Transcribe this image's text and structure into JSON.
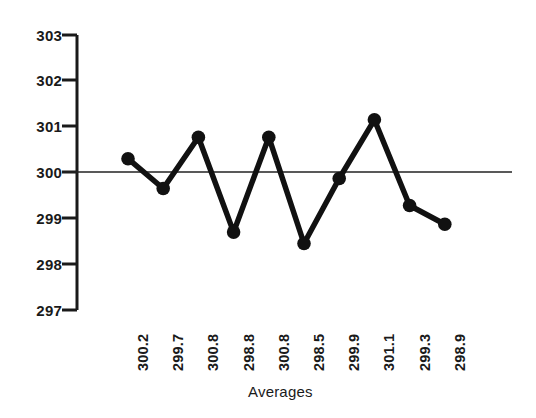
{
  "chart_data": {
    "type": "line",
    "title": "",
    "subtitle": "",
    "xlabel": "Averages",
    "ylabel": "",
    "grid": false,
    "legend": null,
    "ylim": [
      297,
      303
    ],
    "yticks": [
      303,
      302,
      301,
      300,
      299,
      298,
      297
    ],
    "ytick_labels": [
      "303",
      "302",
      "301",
      "300",
      "299",
      "298",
      "297"
    ],
    "categories": [
      "300.2",
      "299.7",
      "300.8",
      "298.8",
      "300.8",
      "298.5",
      "299.9",
      "301.1",
      "299.3",
      "298.9"
    ],
    "xtick_labels": [
      "300.2",
      "299.7",
      "300.8",
      "298.8",
      "300.8",
      "298.5",
      "299.9",
      "301.1",
      "299.3",
      "298.9"
    ],
    "x": [
      1,
      2,
      3,
      4,
      5,
      6,
      7,
      8,
      9,
      10
    ],
    "values": [
      300.3,
      299.65,
      300.77,
      298.7,
      300.77,
      298.45,
      299.87,
      301.15,
      299.28,
      298.87
    ],
    "series": [
      {
        "name": "Averages",
        "values": [
          300.3,
          299.65,
          300.77,
          298.7,
          300.77,
          298.45,
          299.87,
          301.15,
          299.28,
          298.87
        ],
        "color": "#111111",
        "marker": "filled-circle"
      }
    ],
    "reference_lines": [
      {
        "name": "center-line",
        "axis": "y",
        "value": 300,
        "label": "300",
        "color": "#222222"
      }
    ],
    "colors": {
      "line": "#111111",
      "marker": "#111111",
      "axis": "#1a1a1a",
      "reference": "#222222",
      "text": "#1a1a1a",
      "background": "#ffffff"
    }
  }
}
